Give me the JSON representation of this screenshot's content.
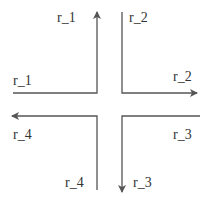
{
  "diagram": {
    "type": "intersection-routes",
    "stroke_color": "#555555",
    "routes": [
      {
        "id": "r_1",
        "in_label": "r_1",
        "out_label": "r_1",
        "entry": "west",
        "exit": "north"
      },
      {
        "id": "r_2",
        "in_label": "r_2",
        "out_label": "r_2",
        "entry": "north",
        "exit": "east"
      },
      {
        "id": "r_3",
        "in_label": "r_3",
        "out_label": "r_3",
        "entry": "east",
        "exit": "south"
      },
      {
        "id": "r_4",
        "in_label": "r_4",
        "out_label": "r_4",
        "entry": "south",
        "exit": "west"
      }
    ]
  }
}
